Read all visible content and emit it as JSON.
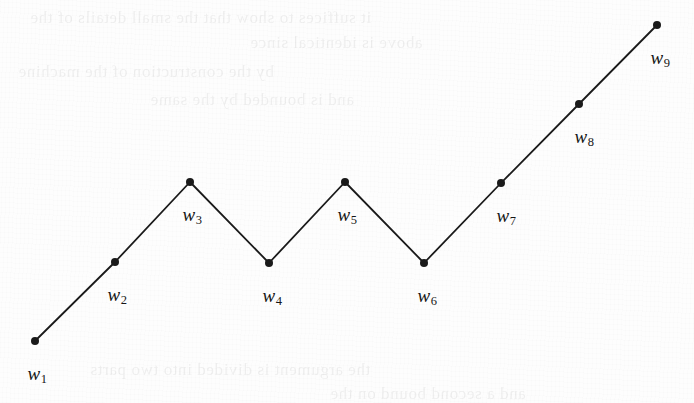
{
  "figure": {
    "background_color": "#fdfdfd",
    "stroke_color": "#1a1a1a",
    "label_color": "#151515",
    "caption": "Zigzag polyline through nine labelled vertices"
  },
  "chart_data": {
    "type": "line",
    "title": "",
    "subtitle": "",
    "xlabel": "",
    "ylabel": "",
    "grid": false,
    "legend": null,
    "axes_visible": false,
    "marker": "filled-circle",
    "marker_size_px": 8,
    "line_width_px": 1.8,
    "xlim": [
      0,
      694
    ],
    "ylim": [
      403,
      0
    ],
    "point_labels": [
      "w1",
      "w2",
      "w3",
      "w4",
      "w5",
      "w6",
      "w7",
      "w8",
      "w9"
    ],
    "x": [
      35,
      115,
      190,
      269,
      345,
      424,
      501,
      579,
      657
    ],
    "y": [
      341,
      262,
      182,
      263,
      182,
      263,
      183,
      104,
      25
    ],
    "points": [
      {
        "label_base": "w",
        "label_sub": "1",
        "x": 35,
        "y": 341,
        "label_x": 37,
        "label_y": 364,
        "kind": "endpoint"
      },
      {
        "label_base": "w",
        "label_sub": "2",
        "x": 115,
        "y": 262,
        "label_x": 117,
        "label_y": 285,
        "kind": "rising"
      },
      {
        "label_base": "w",
        "label_sub": "3",
        "x": 190,
        "y": 182,
        "label_x": 192,
        "label_y": 205,
        "kind": "peak"
      },
      {
        "label_base": "w",
        "label_sub": "4",
        "x": 269,
        "y": 263,
        "label_x": 272,
        "label_y": 286,
        "kind": "valley"
      },
      {
        "label_base": "w",
        "label_sub": "5",
        "x": 345,
        "y": 182,
        "label_x": 347,
        "label_y": 205,
        "kind": "peak"
      },
      {
        "label_base": "w",
        "label_sub": "6",
        "x": 424,
        "y": 263,
        "label_x": 427,
        "label_y": 286,
        "kind": "valley"
      },
      {
        "label_base": "w",
        "label_sub": "7",
        "x": 501,
        "y": 183,
        "label_x": 506,
        "label_y": 206,
        "kind": "rising"
      },
      {
        "label_base": "w",
        "label_sub": "8",
        "x": 579,
        "y": 104,
        "label_x": 584,
        "label_y": 127,
        "kind": "rising"
      },
      {
        "label_base": "w",
        "label_sub": "9",
        "x": 657,
        "y": 25,
        "label_x": 660,
        "label_y": 48,
        "kind": "endpoint"
      }
    ]
  },
  "ghost_text": {
    "note": "Illegible show-through text from the reverse of the scanned page",
    "lines": [
      {
        "text": "it suffices to show that the small details of the",
        "x": 30,
        "y": 8,
        "size": 17
      },
      {
        "text": "above is identical since",
        "x": 250,
        "y": 33,
        "size": 17
      },
      {
        "text": "by the construction of the machine",
        "x": 18,
        "y": 62,
        "size": 17
      },
      {
        "text": "and is bounded by the same",
        "x": 150,
        "y": 90,
        "size": 17
      },
      {
        "text": "the argument is divided into two parts",
        "x": 90,
        "y": 360,
        "size": 17
      },
      {
        "text": "and a second bound on the",
        "x": 330,
        "y": 384,
        "size": 17
      }
    ]
  }
}
